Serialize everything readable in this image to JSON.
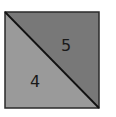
{
  "diagram": {
    "shape": "square divided by diagonal",
    "regions": [
      {
        "name": "lower-left-triangle",
        "label": "4",
        "color": "#9a9a9a"
      },
      {
        "name": "upper-right-triangle",
        "label": "5",
        "color": "#787878"
      }
    ],
    "border_color": "#2a2a2a",
    "diagonal_color": "#111111"
  }
}
